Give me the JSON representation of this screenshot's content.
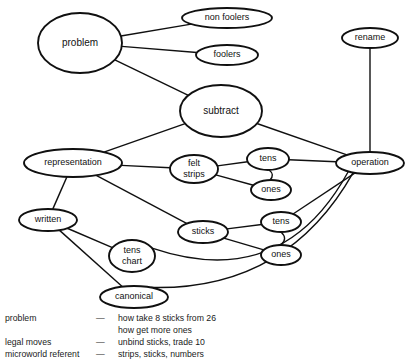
{
  "diagram": {
    "nodes": [
      {
        "id": "problem",
        "label": "problem",
        "cx": 80,
        "cy": 43,
        "rx": 42,
        "ry": 30,
        "size": "big"
      },
      {
        "id": "non_foolers",
        "label": "non foolers",
        "cx": 227,
        "cy": 18,
        "rx": 45,
        "ry": 10,
        "size": "small"
      },
      {
        "id": "foolers",
        "label": "foolers",
        "cx": 227,
        "cy": 55,
        "rx": 31,
        "ry": 10,
        "size": "small"
      },
      {
        "id": "rename",
        "label": "rename",
        "cx": 370,
        "cy": 38,
        "rx": 28,
        "ry": 10,
        "size": "small"
      },
      {
        "id": "subtract",
        "label": "subtract",
        "cx": 221,
        "cy": 111,
        "rx": 41,
        "ry": 26,
        "size": "big"
      },
      {
        "id": "representation",
        "label": "representation",
        "cx": 73,
        "cy": 163,
        "rx": 49,
        "ry": 14,
        "size": "small"
      },
      {
        "id": "felt_strips",
        "label": "felt strips",
        "cx": 194,
        "cy": 169,
        "rx": 24,
        "ry": 14,
        "size": "small"
      },
      {
        "id": "tens_top",
        "label": "tens",
        "cx": 268,
        "cy": 159,
        "rx": 21,
        "ry": 11,
        "size": "small"
      },
      {
        "id": "ones_top",
        "label": "ones",
        "cx": 271,
        "cy": 190,
        "rx": 20,
        "ry": 10,
        "size": "small"
      },
      {
        "id": "operation",
        "label": "operation",
        "cx": 370,
        "cy": 163,
        "rx": 34,
        "ry": 11,
        "size": "small"
      },
      {
        "id": "written",
        "label": "written",
        "cx": 48,
        "cy": 220,
        "rx": 29,
        "ry": 11,
        "size": "small"
      },
      {
        "id": "sticks",
        "label": "sticks",
        "cx": 203,
        "cy": 232,
        "rx": 25,
        "ry": 11,
        "size": "small"
      },
      {
        "id": "tens_bot",
        "label": "tens",
        "cx": 281,
        "cy": 222,
        "rx": 20,
        "ry": 10,
        "size": "small"
      },
      {
        "id": "ones_bot",
        "label": "ones",
        "cx": 281,
        "cy": 255,
        "rx": 20,
        "ry": 10,
        "size": "small"
      },
      {
        "id": "tens_chart",
        "label": "tens chart",
        "cx": 132,
        "cy": 256,
        "rx": 23,
        "ry": 16,
        "size": "small"
      },
      {
        "id": "canonical",
        "label": "canonical",
        "cx": 134,
        "cy": 297,
        "rx": 34,
        "ry": 11,
        "size": "small"
      }
    ],
    "edges": [
      {
        "from": "problem",
        "to": "non_foolers"
      },
      {
        "from": "problem",
        "to": "foolers"
      },
      {
        "from": "problem",
        "to": "subtract"
      },
      {
        "from": "rename",
        "to": "operation"
      },
      {
        "from": "subtract",
        "to": "representation"
      },
      {
        "from": "subtract",
        "to": "operation"
      },
      {
        "from": "representation",
        "to": "felt_strips"
      },
      {
        "from": "representation",
        "to": "written"
      },
      {
        "from": "representation",
        "to": "sticks"
      },
      {
        "from": "felt_strips",
        "to": "tens_top"
      },
      {
        "from": "felt_strips",
        "to": "ones_top"
      },
      {
        "from": "tens_top",
        "to": "ones_top"
      },
      {
        "from": "tens_top",
        "to": "operation"
      },
      {
        "from": "sticks",
        "to": "tens_bot"
      },
      {
        "from": "sticks",
        "to": "ones_bot"
      },
      {
        "from": "tens_bot",
        "to": "ones_bot"
      },
      {
        "from": "tens_bot",
        "to": "operation"
      },
      {
        "from": "written",
        "to": "tens_chart"
      },
      {
        "from": "written",
        "to": "canonical"
      },
      {
        "from": "tens_chart",
        "to": "operation"
      },
      {
        "from": "canonical",
        "to": "operation"
      }
    ]
  },
  "legend": {
    "rows": [
      {
        "term": "problem",
        "dash": "—",
        "value": "how take 8 sticks from 26"
      },
      {
        "term": "",
        "dash": "",
        "value": "how get more ones"
      },
      {
        "term": "legal moves",
        "dash": "—",
        "value": "unbind sticks, trade 10"
      },
      {
        "term": "microworld referent",
        "dash": "—",
        "value": "strips, sticks, numbers"
      }
    ]
  },
  "style": {
    "stroke": "#101010",
    "fill": "#ffffff",
    "text": "#111111"
  }
}
